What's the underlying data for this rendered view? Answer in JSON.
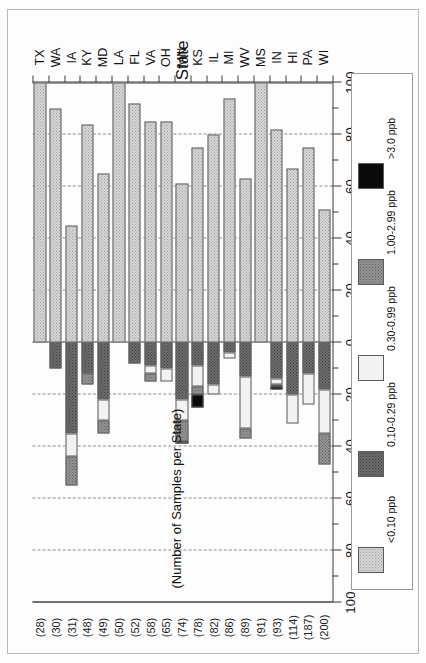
{
  "figure": {
    "category_axis_title": "State",
    "samples_note": "(Number of Samples per State)",
    "caption_above": "% Above LOD",
    "caption_below": "% Below LOD",
    "caption_above_lines": [
      "%",
      "Above",
      "LOD"
    ],
    "caption_below_lines": [
      "%",
      "Below",
      "LOD"
    ]
  },
  "legend": {
    "items": [
      {
        "label": "<0.10 ppb",
        "swatch": "p1",
        "color": "#d7d7d7"
      },
      {
        "label": "0.10-0.29 ppb",
        "swatch": "p2",
        "color": "#6e6e6e"
      },
      {
        "label": "0.30-0.99 ppb",
        "swatch": "p3",
        "color": "#f2f2f2"
      },
      {
        "label": "1.00-2.99 ppb",
        "swatch": "p4",
        "color": "#969696"
      },
      {
        "label": ">3.0 ppb",
        "swatch": "p5",
        "color": "#0a0a0a"
      }
    ]
  },
  "chart_data": {
    "type": "bar",
    "orientation": "horizontal-diverging-stacked",
    "title": "",
    "xlabel": "State",
    "ylabel": "% Above LOD / % Below LOD",
    "axis_ticks": [
      {
        "value": -100,
        "label": "100"
      },
      {
        "value": -80,
        "label": "80"
      },
      {
        "value": -60,
        "label": "60"
      },
      {
        "value": -40,
        "label": "40"
      },
      {
        "value": -20,
        "label": "20"
      },
      {
        "value": 0,
        "label": "0"
      },
      {
        "value": 20,
        "label": "20"
      },
      {
        "value": 40,
        "label": "40"
      },
      {
        "value": 60,
        "label": "60"
      },
      {
        "value": 80,
        "label": "80"
      },
      {
        "value": 100,
        "label": "100"
      }
    ],
    "xlim": [
      -100,
      100
    ],
    "grid": "dashed vertical at every 20 units",
    "legend_position": "right",
    "series": [
      {
        "name": "<0.10 ppb",
        "key": "below_lod",
        "side": "positive",
        "swatch": "p1"
      },
      {
        "name": "0.10-0.29 ppb",
        "key": "s_010_029",
        "side": "negative",
        "swatch": "p2"
      },
      {
        "name": "0.30-0.99 ppb",
        "key": "s_030_099",
        "side": "negative",
        "swatch": "p3"
      },
      {
        "name": "1.00-2.99 ppb",
        "key": "s_100_299",
        "side": "negative",
        "swatch": "p4"
      },
      {
        "name": ">3.0 ppb",
        "key": "s_gt3",
        "side": "negative",
        "swatch": "p5"
      }
    ],
    "categories": [
      "WI",
      "PA",
      "HI",
      "IN",
      "MS",
      "WV",
      "MI",
      "IL",
      "KS",
      "MN",
      "OH",
      "VA",
      "FL",
      "LA",
      "MD",
      "KY",
      "IA",
      "WA",
      "TX"
    ],
    "sample_counts": [
      200,
      187,
      114,
      93,
      91,
      89,
      86,
      82,
      78,
      74,
      65,
      58,
      52,
      50,
      49,
      48,
      31,
      30,
      28
    ],
    "sample_count_labels": [
      "(200)",
      "(187)",
      "(114)",
      "(93)",
      "(91)",
      "(89)",
      "(86)",
      "(82)",
      "(78)",
      "(74)",
      "(65)",
      "(58)",
      "(52)",
      "(50)",
      "(49)",
      "(48)",
      "(31)",
      "(30)",
      "(28)"
    ],
    "rows": [
      {
        "state": "WI",
        "n": 200,
        "below_lod": 51,
        "s_010_029": 18,
        "s_030_099": 17,
        "s_100_299": 12,
        "s_gt3": 0
      },
      {
        "state": "PA",
        "n": 187,
        "below_lod": 75,
        "s_010_029": 12,
        "s_030_099": 12,
        "s_100_299": 0,
        "s_gt3": 0
      },
      {
        "state": "HI",
        "n": 114,
        "below_lod": 67,
        "s_010_029": 20,
        "s_030_099": 11,
        "s_100_299": 0,
        "s_gt3": 0
      },
      {
        "state": "IN",
        "n": 93,
        "below_lod": 82,
        "s_010_029": 14,
        "s_030_099": 2,
        "s_100_299": 1,
        "s_gt3": 1
      },
      {
        "state": "MS",
        "n": 91,
        "below_lod": 100,
        "s_010_029": 0,
        "s_030_099": 0,
        "s_100_299": 0,
        "s_gt3": 0
      },
      {
        "state": "WV",
        "n": 89,
        "below_lod": 63,
        "s_010_029": 13,
        "s_030_099": 20,
        "s_100_299": 4,
        "s_gt3": 0
      },
      {
        "state": "MI",
        "n": 86,
        "below_lod": 94,
        "s_010_029": 4,
        "s_030_099": 2,
        "s_100_299": 0,
        "s_gt3": 0
      },
      {
        "state": "IL",
        "n": 82,
        "below_lod": 80,
        "s_010_029": 16,
        "s_030_099": 4,
        "s_100_299": 0,
        "s_gt3": 0
      },
      {
        "state": "KS",
        "n": 78,
        "below_lod": 75,
        "s_010_029": 9,
        "s_030_099": 8,
        "s_100_299": 3,
        "s_gt3": 5
      },
      {
        "state": "MN",
        "n": 74,
        "below_lod": 61,
        "s_010_029": 22,
        "s_030_099": 8,
        "s_100_299": 8,
        "s_gt3": 1
      },
      {
        "state": "OH",
        "n": 65,
        "below_lod": 85,
        "s_010_299": 0,
        "s_010_029": 10,
        "s_030_099": 5,
        "s_100_299": 0,
        "s_gt3": 0
      },
      {
        "state": "VA",
        "n": 58,
        "below_lod": 85,
        "s_010_029": 9,
        "s_030_099": 3,
        "s_100_299": 3,
        "s_gt3": 0
      },
      {
        "state": "FL",
        "n": 52,
        "below_lod": 92,
        "s_010_029": 8,
        "s_030_099": 0,
        "s_100_299": 0,
        "s_gt3": 0
      },
      {
        "state": "LA",
        "n": 50,
        "below_lod": 100,
        "s_010_029": 0,
        "s_030_099": 0,
        "s_100_299": 0,
        "s_gt3": 0
      },
      {
        "state": "MD",
        "n": 49,
        "below_lod": 65,
        "s_010_029": 22,
        "s_030_099": 8,
        "s_100_299": 5,
        "s_gt3": 0
      },
      {
        "state": "KY",
        "n": 48,
        "below_lod": 84,
        "s_010_029": 12,
        "s_030_099": 0,
        "s_100_299": 4,
        "s_gt3": 0
      },
      {
        "state": "IA",
        "n": 31,
        "below_lod": 45,
        "s_010_029": 35,
        "s_030_099": 9,
        "s_100_299": 11,
        "s_gt3": 0
      },
      {
        "state": "WA",
        "n": 30,
        "below_lod": 90,
        "s_010_029": 10,
        "s_030_099": 0,
        "s_100_299": 0,
        "s_gt3": 0
      },
      {
        "state": "TX",
        "n": 28,
        "below_lod": 100,
        "s_010_029": 0,
        "s_030_099": 0,
        "s_100_299": 0,
        "s_gt3": 0
      }
    ]
  }
}
